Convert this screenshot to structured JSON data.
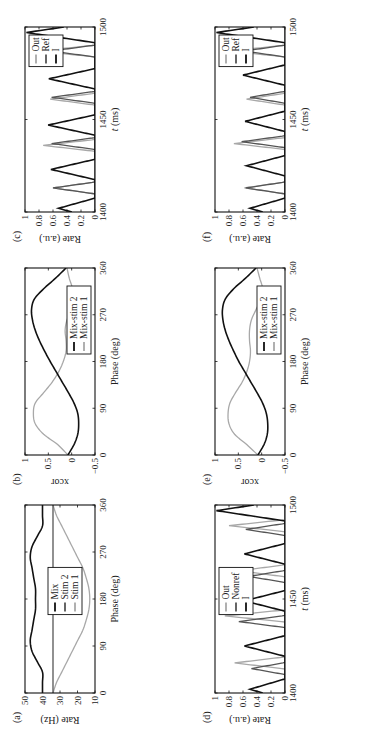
{
  "figure": {
    "orientation": "rotated 90 degrees counterclockwise",
    "colors": {
      "black": "#111111",
      "dark_gray": "#555555",
      "light_gray": "#a8a8a8"
    }
  },
  "chart_data": [
    {
      "id": "a",
      "panel_label": "(a)",
      "type": "line",
      "title": "",
      "xlabel": "Phase (deg)",
      "ylabel": "Rate (Hz)",
      "xlim": [
        0,
        360
      ],
      "ylim": [
        10,
        50
      ],
      "xticks": [
        0,
        90,
        180,
        270,
        360
      ],
      "yticks": [
        10,
        20,
        30,
        40,
        50
      ],
      "legend": [
        "Mix",
        "Stim 2",
        "Stim 1"
      ],
      "legend_position": "center",
      "series": [
        {
          "name": "Mix",
          "color": "#111111",
          "x": [
            0,
            20,
            40,
            60,
            80,
            100,
            120,
            140,
            160,
            180,
            200,
            220,
            240,
            260,
            280,
            300,
            320,
            340,
            360
          ],
          "y": [
            40,
            40,
            40,
            43,
            46,
            47,
            46,
            45,
            44,
            44,
            44,
            45,
            46,
            47,
            46,
            43,
            40,
            40,
            40
          ]
        },
        {
          "name": "Stim 2",
          "color": "#555555",
          "x": [
            0,
            360
          ],
          "y": [
            34,
            34
          ]
        },
        {
          "name": "Stim 1",
          "color": "#a8a8a8",
          "x": [
            0,
            20,
            40,
            60,
            80,
            100,
            120,
            140,
            160,
            180,
            200,
            220,
            240,
            260,
            280,
            300,
            320,
            340,
            360
          ],
          "y": [
            34,
            32,
            29,
            26,
            23,
            20,
            17,
            15,
            13.5,
            13,
            13.5,
            15,
            17,
            20,
            23,
            26,
            29,
            32,
            34
          ]
        }
      ]
    },
    {
      "id": "b",
      "panel_label": "(b)",
      "type": "line",
      "title": "",
      "xlabel": "Phase (deg)",
      "ylabel": "xcor",
      "xlim": [
        0,
        360
      ],
      "ylim": [
        -0.5,
        1
      ],
      "xticks": [
        0,
        90,
        180,
        270,
        360
      ],
      "yticks": [
        -0.5,
        0,
        0.5,
        1
      ],
      "legend": [
        "Mix-stim 2",
        "Mix-stim 1"
      ],
      "legend_position": "lower right",
      "series": [
        {
          "name": "Mix-stim 2",
          "color": "#111111",
          "x": [
            0,
            20,
            40,
            60,
            80,
            100,
            120,
            140,
            160,
            180,
            200,
            220,
            240,
            260,
            280,
            300,
            320,
            340,
            360
          ],
          "y": [
            0.08,
            -0.05,
            -0.13,
            -0.15,
            -0.13,
            -0.05,
            0.07,
            0.2,
            0.33,
            0.46,
            0.58,
            0.69,
            0.78,
            0.84,
            0.86,
            0.8,
            0.6,
            0.35,
            0.12
          ]
        },
        {
          "name": "Mix-stim 1",
          "color": "#a8a8a8",
          "x": [
            0,
            20,
            40,
            60,
            80,
            100,
            120,
            140,
            160,
            180,
            200,
            220,
            240,
            260,
            280,
            300,
            320,
            340,
            360
          ],
          "y": [
            0.08,
            0.3,
            0.6,
            0.78,
            0.82,
            0.78,
            0.6,
            0.42,
            0.28,
            0.18,
            0.12,
            0.12,
            0.14,
            0.1,
            0.0,
            -0.05,
            -0.02,
            0.05,
            0.1
          ]
        }
      ]
    },
    {
      "id": "c",
      "panel_label": "(c)",
      "type": "line",
      "title": "",
      "xlabel": "t (ms)",
      "ylabel": "Rate (a.u.)",
      "xlim": [
        1400,
        1500
      ],
      "ylim": [
        0,
        1
      ],
      "xticks": [
        1400,
        1450,
        1500
      ],
      "yticks": [
        0,
        0.2,
        0.4,
        0.6,
        0.8,
        1
      ],
      "legend": [
        "Out",
        "Ref",
        "I"
      ],
      "legend_position": "upper right",
      "series": [
        {
          "name": "I",
          "color": "#111111",
          "peaks_ms": [
            1402,
            1423,
            1447,
            1472,
            1497
          ],
          "peak_heights": [
            0.52,
            0.63,
            0.67,
            0.66,
            0.98
          ]
        },
        {
          "name": "Ref",
          "color": "#555555",
          "peaks_ms": [
            1413,
            1437,
            1462,
            1487
          ],
          "peak_heights": [
            0.6,
            0.62,
            0.62,
            0.63
          ]
        },
        {
          "name": "Out",
          "color": "#a8a8a8",
          "peaks_ms": [
            1413,
            1436,
            1461,
            1487
          ],
          "peak_heights": [
            0.6,
            0.74,
            0.64,
            0.8
          ]
        }
      ]
    },
    {
      "id": "d",
      "panel_label": "(d)",
      "type": "line",
      "title": "",
      "xlabel": "t (ms)",
      "ylabel": "Rate (a.u.)",
      "xlim": [
        1400,
        1500
      ],
      "ylim": [
        0,
        1
      ],
      "xticks": [
        1400,
        1450,
        1500
      ],
      "yticks": [
        0,
        0.2,
        0.4,
        0.6,
        0.8,
        1
      ],
      "legend": [
        "Out",
        "Nonref",
        "I"
      ],
      "legend_position": "upper center",
      "series": [
        {
          "name": "I",
          "color": "#111111",
          "peaks_ms": [
            1402,
            1425,
            1449,
            1474,
            1497
          ],
          "peak_heights": [
            0.5,
            0.58,
            0.58,
            0.58,
            0.98
          ]
        },
        {
          "name": "Nonref",
          "color": "#555555",
          "peaks_ms": [
            1413,
            1438,
            1462,
            1487
          ],
          "peak_heights": [
            0.48,
            0.66,
            0.52,
            0.56
          ]
        },
        {
          "name": "Out",
          "color": "#a8a8a8",
          "peaks_ms": [
            1416,
            1441,
            1465,
            1489
          ],
          "peak_heights": [
            0.72,
            0.86,
            0.65,
            0.8
          ]
        }
      ]
    },
    {
      "id": "e",
      "panel_label": "(e)",
      "type": "line",
      "title": "",
      "xlabel": "Phase (deg)",
      "ylabel": "xcor",
      "xlim": [
        0,
        360
      ],
      "ylim": [
        -0.5,
        1
      ],
      "xticks": [
        0,
        90,
        180,
        270,
        360
      ],
      "yticks": [
        -0.5,
        0,
        0.5,
        1
      ],
      "legend": [
        "Mix-stim 2",
        "Mix-stim 1"
      ],
      "legend_position": "lower right",
      "series": [
        {
          "name": "Mix-stim 2",
          "color": "#111111",
          "x": [
            0,
            20,
            40,
            60,
            80,
            100,
            120,
            140,
            160,
            180,
            200,
            220,
            240,
            260,
            280,
            300,
            320,
            340,
            360
          ],
          "y": [
            0.08,
            -0.05,
            -0.12,
            -0.13,
            -0.1,
            -0.02,
            0.1,
            0.23,
            0.36,
            0.49,
            0.6,
            0.7,
            0.78,
            0.83,
            0.84,
            0.78,
            0.6,
            0.35,
            0.12
          ]
        },
        {
          "name": "Mix-stim 1",
          "color": "#a8a8a8",
          "x": [
            0,
            20,
            40,
            60,
            80,
            100,
            120,
            140,
            160,
            180,
            200,
            220,
            240,
            260,
            280,
            300,
            320,
            340,
            360
          ],
          "y": [
            0.08,
            0.32,
            0.58,
            0.7,
            0.72,
            0.68,
            0.56,
            0.42,
            0.32,
            0.26,
            0.24,
            0.26,
            0.26,
            0.22,
            0.12,
            0.02,
            -0.02,
            0.04,
            0.1
          ]
        }
      ]
    },
    {
      "id": "f",
      "panel_label": "(f)",
      "type": "line",
      "title": "",
      "xlabel": "t (ms)",
      "ylabel": "Rate (a.u.)",
      "xlim": [
        1400,
        1500
      ],
      "ylim": [
        0,
        1
      ],
      "xticks": [
        1400,
        1450,
        1500
      ],
      "yticks": [
        0,
        0.2,
        0.4,
        0.6,
        0.8,
        1
      ],
      "legend": [
        "Out",
        "Ref",
        "I"
      ],
      "legend_position": "upper right",
      "series": [
        {
          "name": "I",
          "color": "#111111",
          "peaks_ms": [
            1402,
            1425,
            1449,
            1474,
            1497
          ],
          "peak_heights": [
            0.5,
            0.55,
            0.57,
            0.6,
            0.98
          ]
        },
        {
          "name": "Ref",
          "color": "#555555",
          "peaks_ms": [
            1413,
            1438,
            1462,
            1487
          ],
          "peak_heights": [
            0.56,
            0.62,
            0.5,
            0.58
          ]
        },
        {
          "name": "Out",
          "color": "#a8a8a8",
          "peaks_ms": [
            1413,
            1437,
            1461,
            1487
          ],
          "peak_heights": [
            0.58,
            0.73,
            0.55,
            0.78
          ]
        }
      ]
    }
  ]
}
